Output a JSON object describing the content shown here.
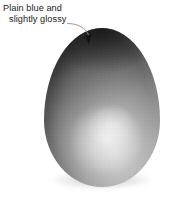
{
  "figure": {
    "background_color": "#ffffff",
    "annotation": {
      "line_1": "Plain blue and",
      "line_2": "slightly glossy",
      "text_color": "#1c1c1c",
      "leader_line_color": "#8c8c8c",
      "arrow_color": "#1a1a1a"
    },
    "subject": {
      "name": "egg",
      "shape": "ovoid",
      "surface": "plain blue and slightly glossy",
      "highlight_color": "#c9c9c9",
      "shadow_color": "#343434",
      "midtone_color": "#8e8e8e",
      "ground_shadow_color": "#9a9a9a"
    }
  }
}
